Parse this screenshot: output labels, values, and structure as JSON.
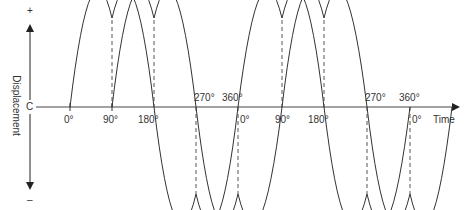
{
  "diagram": {
    "y_axis": {
      "label": "Displacement",
      "plus": "+",
      "minus": "–",
      "center": "C"
    },
    "x_axis": {
      "label": "Time"
    },
    "ticks_lower": [
      "0°",
      "90°",
      "180°",
      "0°",
      "90°",
      "180°",
      "0°"
    ],
    "ticks_upper": [
      "270°",
      "360°",
      "270°",
      "360°"
    ],
    "colors": {
      "line": "#333333",
      "dashed": "#555555"
    }
  }
}
